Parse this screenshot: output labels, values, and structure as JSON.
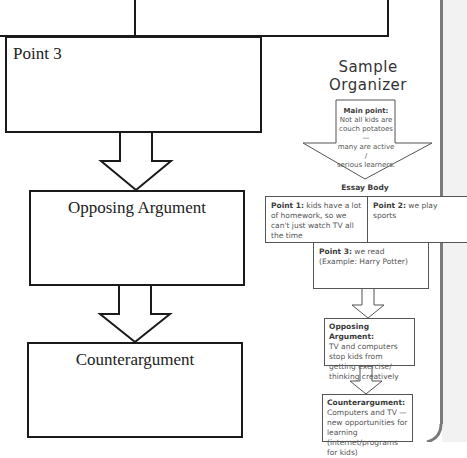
{
  "blank_organizer": {
    "boxes": [
      {
        "id": "point-3",
        "label": "Point 3"
      },
      {
        "id": "opposing-argument",
        "label": "Opposing Argument"
      },
      {
        "id": "counterargument",
        "label": "Counterargument"
      }
    ]
  },
  "sample_organizer": {
    "title_line1": "Sample",
    "title_line2": "Organizer",
    "main_point": {
      "label": "Main point:",
      "text_lines": [
        "Not all kids are",
        "couch potatoes—",
        "many are active /",
        "serious learners."
      ]
    },
    "essay_body_label": "Essay Body",
    "point1": {
      "label": "Point 1:",
      "text": " kids have a lot of homework, so we can't just watch TV all the time"
    },
    "point2": {
      "label": "Point 2:",
      "text": " we play sports"
    },
    "point3": {
      "label": "Point 3:",
      "text": " we read",
      "text2": "(Example: Harry Potter)"
    },
    "opposing": {
      "label": "Opposing Argument:",
      "text": "TV and computers stop kids from getting exercise/ thinking creatively"
    },
    "counter": {
      "label": "Counterargument:",
      "text": "Computers and TV —new opportunities for learning (internet/programs for kids)"
    }
  },
  "colors": {
    "line_dark": "#1a1a1a",
    "sample_line": "#555555",
    "side_strip": "#f2f2f2",
    "side_line": "#7a7a7a"
  }
}
